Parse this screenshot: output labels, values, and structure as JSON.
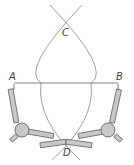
{
  "diagram": {
    "points": {
      "A": {
        "label": "A",
        "x": 14,
        "y": 83
      },
      "B": {
        "label": "B",
        "x": 118,
        "y": 83
      },
      "C": {
        "label": "C"
      },
      "D": {
        "label": "D"
      }
    },
    "colors": {
      "line": "#666666",
      "compass_fill": "#c8c8c8",
      "compass_stroke": "#555555",
      "label": "#444444"
    }
  }
}
